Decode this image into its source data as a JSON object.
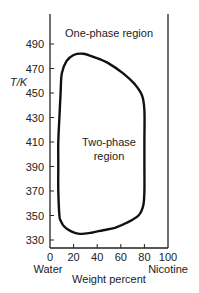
{
  "chart_data": {
    "type": "line",
    "title": "",
    "xlabel": "Weight percent",
    "ylabel": "T/K",
    "x_left_label": "Water",
    "x_right_label": "Nicotine",
    "xlim": [
      0,
      100
    ],
    "ylim": [
      326,
      510
    ],
    "x_ticks": [
      0,
      20,
      40,
      60,
      80,
      100
    ],
    "y_ticks": [
      330,
      350,
      370,
      390,
      410,
      430,
      450,
      470,
      490
    ],
    "annotations": [
      {
        "text": "One-phase region",
        "x": 50,
        "y": 502
      },
      {
        "text": "Two-phase",
        "x": 50,
        "y": 406
      },
      {
        "text": "region",
        "x": 50,
        "y": 396
      }
    ],
    "grid": false,
    "legend": null,
    "series": [
      {
        "name": "Phase boundary (closed loop)",
        "closed": true,
        "points": [
          [
            8,
            350
          ],
          [
            7,
            370
          ],
          [
            7,
            390
          ],
          [
            7,
            410
          ],
          [
            8,
            430
          ],
          [
            9,
            450
          ],
          [
            10,
            466
          ],
          [
            14,
            476
          ],
          [
            20,
            481
          ],
          [
            28,
            482
          ],
          [
            38,
            479
          ],
          [
            50,
            474
          ],
          [
            62,
            466
          ],
          [
            72,
            457
          ],
          [
            78,
            448
          ],
          [
            80,
            436
          ],
          [
            80,
            410
          ],
          [
            80,
            390
          ],
          [
            80,
            370
          ],
          [
            79,
            358
          ],
          [
            75,
            350
          ],
          [
            65,
            344
          ],
          [
            55,
            340
          ],
          [
            45,
            338
          ],
          [
            35,
            336
          ],
          [
            25,
            335
          ],
          [
            18,
            337
          ],
          [
            12,
            341
          ],
          [
            9,
            346
          ]
        ]
      }
    ]
  },
  "labels": {
    "title_region": "One-phase region",
    "two_phase_line1": "Two-phase",
    "two_phase_line2": "region",
    "ylabel": "T/K",
    "xlabel": "Weight percent",
    "left_component": "Water",
    "right_component": "Nicotine"
  }
}
